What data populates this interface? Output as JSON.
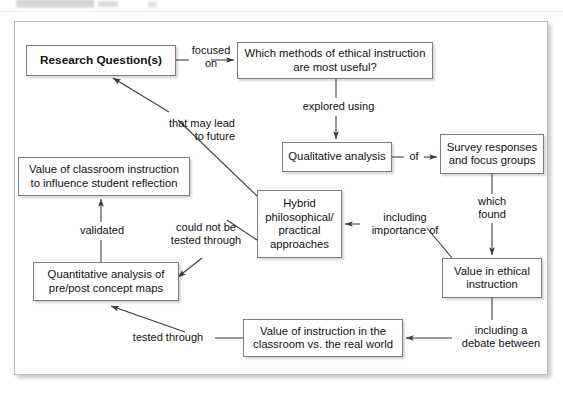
{
  "window": {
    "top_strip_visible": true
  },
  "diagram": {
    "title": "",
    "type": "concept-map",
    "nodes": [
      {
        "id": "research_question",
        "label": "Research Question(s)",
        "bold": true,
        "x": 26,
        "y": 45,
        "w": 150,
        "h": 31
      },
      {
        "id": "which_methods",
        "label": "Which methods of ethical instruction are most useful?",
        "bold": false,
        "x": 237,
        "y": 42,
        "w": 196,
        "h": 37
      },
      {
        "id": "qualitative",
        "label": "Qualitative analysis",
        "bold": false,
        "x": 282,
        "y": 142,
        "w": 110,
        "h": 30
      },
      {
        "id": "survey",
        "label": "Survey responses and focus groups",
        "bold": false,
        "x": 440,
        "y": 134,
        "w": 104,
        "h": 40
      },
      {
        "id": "value_classroom",
        "label": "Value of classroom instruction to influence student reflection",
        "bold": false,
        "x": 18,
        "y": 157,
        "w": 172,
        "h": 39
      },
      {
        "id": "hybrid",
        "label": "Hybrid philosophical/ practical approaches",
        "bold": false,
        "x": 257,
        "y": 190,
        "w": 85,
        "h": 68
      },
      {
        "id": "value_ethical",
        "label": "Value in ethical instruction",
        "bold": false,
        "x": 442,
        "y": 258,
        "w": 100,
        "h": 40
      },
      {
        "id": "quantitative",
        "label": "Quantitative analysis of pre/post concept maps",
        "bold": false,
        "x": 33,
        "y": 262,
        "w": 146,
        "h": 39
      },
      {
        "id": "value_instruction",
        "label": "Value of instruction in the classroom vs. the real world",
        "bold": false,
        "x": 243,
        "y": 319,
        "w": 160,
        "h": 38
      }
    ],
    "edge_labels": [
      {
        "id": "focused_on",
        "text": "focused\non",
        "x": 186,
        "y": 44,
        "w": 50
      },
      {
        "id": "explored_using",
        "text": "explored using",
        "x": 296,
        "y": 100,
        "w": 90
      },
      {
        "id": "of",
        "text": "of",
        "x": 406,
        "y": 148,
        "w": 18
      },
      {
        "id": "which_found",
        "text": "which\nfound",
        "x": 468,
        "y": 196,
        "w": 48
      },
      {
        "id": "that_may_lead",
        "text": "that may lead\nto future",
        "x": 151,
        "y": 120,
        "w": 84
      },
      {
        "id": "including_importance",
        "text": "including\nimportance of",
        "x": 362,
        "y": 212,
        "w": 84
      },
      {
        "id": "could_not_be_tested",
        "text": "could not be\ntested through",
        "x": 165,
        "y": 222,
        "w": 82
      },
      {
        "id": "validated",
        "text": "validated",
        "x": 73,
        "y": 224,
        "w": 58
      },
      {
        "id": "tested_through",
        "text": "tested through",
        "x": 122,
        "y": 325,
        "w": 90
      },
      {
        "id": "including_debate",
        "text": "including a\ndebate between",
        "x": 456,
        "y": 324,
        "w": 92
      }
    ],
    "colors": {
      "node_border": "#7d7d7d",
      "node_fill": "#ffffff",
      "frame_border": "#bcbcbc",
      "edge_stroke": "#3a3a3a",
      "text": "#111111"
    }
  }
}
